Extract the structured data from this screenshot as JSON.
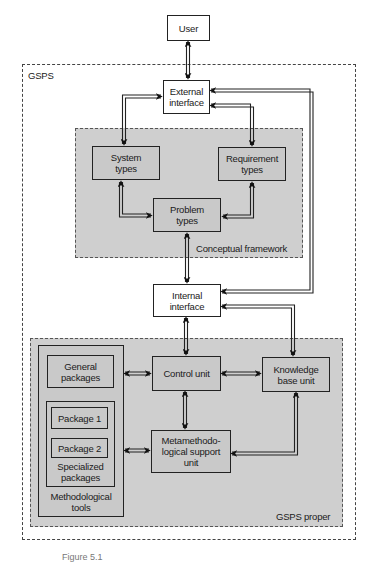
{
  "diagram": {
    "nodes": {
      "user": "User",
      "external_interface": "External interface",
      "system_types": "System types",
      "requirement_types": "Requirement types",
      "problem_types": "Problem types",
      "internal_interface": "Internal interface",
      "general_packages": "General packages",
      "package_1": "Package 1",
      "package_2": "Package 2",
      "specialized_packages": "Specialized packages",
      "methodological_tools": "Methodological tools",
      "control_unit": "Control unit",
      "knowledge_base_unit": "Knowledge base unit",
      "metamethodological_support_unit": "Metamethodo- logical support unit"
    },
    "regions": {
      "gsps": "GSPS",
      "conceptual_framework": "Conceptual framework",
      "gsps_proper": "GSPS proper"
    },
    "edges": [
      {
        "from": "User",
        "to": "External interface",
        "type": "bidirectional"
      },
      {
        "from": "External interface",
        "to": "System types",
        "type": "bidirectional"
      },
      {
        "from": "External interface",
        "to": "Requirement types",
        "type": "bidirectional"
      },
      {
        "from": "System types",
        "to": "Problem types",
        "type": "bidirectional"
      },
      {
        "from": "Requirement types",
        "to": "Problem types",
        "type": "bidirectional"
      },
      {
        "from": "Problem types",
        "to": "Internal interface",
        "type": "bidirectional"
      },
      {
        "from": "External interface",
        "to": "Internal interface",
        "type": "bidirectional"
      },
      {
        "from": "Internal interface",
        "to": "Control unit",
        "type": "bidirectional"
      },
      {
        "from": "Internal interface",
        "to": "Knowledge base unit",
        "type": "bidirectional"
      },
      {
        "from": "General packages",
        "to": "Control unit",
        "type": "bidirectional"
      },
      {
        "from": "Control unit",
        "to": "Knowledge base unit",
        "type": "bidirectional"
      },
      {
        "from": "Control unit",
        "to": "Metamethodological support unit",
        "type": "bidirectional"
      },
      {
        "from": "Specialized packages",
        "to": "Metamethodological support unit",
        "type": "bidirectional"
      },
      {
        "from": "Knowledge base unit",
        "to": "Metamethodological support unit",
        "type": "bidirectional"
      }
    ],
    "caption": "Figure 5.1"
  }
}
